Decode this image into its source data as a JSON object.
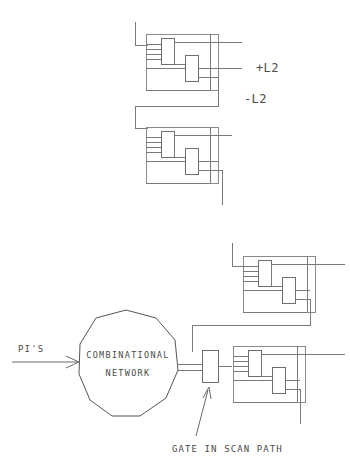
{
  "diagram": {
    "labels": {
      "clock_plus_l2": "+L2",
      "clock_minus_l2": "-L2",
      "primary_inputs": "PI'S",
      "network_line1": "COMBINATIONAL",
      "network_line2": "NETWORK",
      "gate_annotation": "GATE IN SCAN PATH"
    },
    "colors": {
      "background": "#ffffff",
      "wire": "#7a7a7a",
      "box_outline": "#8a8a8a",
      "text": "#4a4a4a"
    },
    "blocks": [
      {
        "name": "srl-block-top-1",
        "role": "shift register latch block"
      },
      {
        "name": "srl-block-top-2",
        "role": "shift register latch block"
      },
      {
        "name": "srl-block-bottom-1",
        "role": "shift register latch block"
      },
      {
        "name": "srl-block-bottom-2",
        "role": "shift register latch block"
      }
    ],
    "gate": {
      "name": "scan-path-gate",
      "role": "gate in scan path"
    },
    "network": {
      "name": "combinational-network",
      "shape": "decagon"
    }
  }
}
